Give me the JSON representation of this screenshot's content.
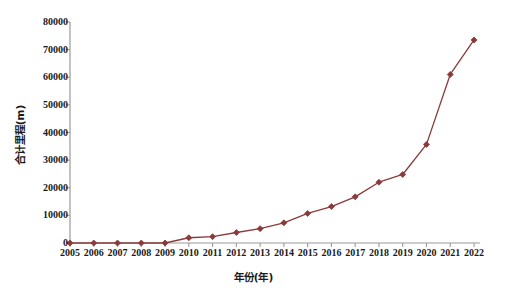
{
  "chart_data": {
    "type": "line",
    "title": "",
    "xlabel": "年份(年)",
    "ylabel": "合计里程(m)",
    "categories": [
      "2005",
      "2006",
      "2007",
      "2008",
      "2009",
      "2010",
      "2011",
      "2012",
      "2013",
      "2014",
      "2015",
      "2016",
      "2017",
      "2018",
      "2019",
      "2020",
      "2021",
      "2022"
    ],
    "x": [
      2005,
      2006,
      2007,
      2008,
      2009,
      2010,
      2011,
      2012,
      2013,
      2014,
      2015,
      2016,
      2017,
      2018,
      2019,
      2020,
      2021,
      2022
    ],
    "values": [
      0,
      0,
      0,
      0,
      0,
      1900,
      2300,
      3800,
      5200,
      7300,
      10700,
      13200,
      16700,
      22000,
      24800,
      35700,
      61000,
      73500
    ],
    "series": [
      {
        "name": "合计里程(m)",
        "values": [
          0,
          0,
          0,
          0,
          0,
          1900,
          2300,
          3800,
          5200,
          7300,
          10700,
          13200,
          16700,
          22000,
          24800,
          35700,
          61000,
          73500
        ],
        "color": "#8B3A3A",
        "marker": "diamond"
      }
    ],
    "ylim": [
      0,
      80000
    ],
    "yticks": [
      0,
      10000,
      20000,
      30000,
      40000,
      50000,
      60000,
      70000,
      80000
    ],
    "ytick_labels": [
      "0",
      "10000",
      "20000",
      "30000",
      "40000",
      "50000",
      "60000",
      "70000",
      "80000"
    ],
    "xtick_labels": [
      "2005",
      "2006",
      "2007",
      "2008",
      "2009",
      "2010",
      "2011",
      "2012",
      "2013",
      "2014",
      "2015",
      "2016",
      "2017",
      "2018",
      "2019",
      "2020",
      "2021",
      "2022"
    ],
    "grid": false,
    "legend": false,
    "legend_position": "none",
    "axis_color": "#9a9a9a",
    "tick_direction": "out",
    "spines": [
      "left",
      "bottom"
    ]
  },
  "caption": {
    "text": ""
  }
}
